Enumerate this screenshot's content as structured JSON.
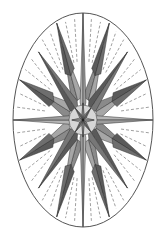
{
  "geometry": {
    "cx": 83,
    "cy": 120,
    "rx": 70,
    "ry": 107
  },
  "colors": {
    "outline": "#555555",
    "cardinal": "#b4b4b4",
    "secondary": "#5a5a5a",
    "tertiary": "#8a8a8a",
    "inner_light": "#d6d6d6",
    "background": "#ffffff",
    "dash": "#777777"
  }
}
